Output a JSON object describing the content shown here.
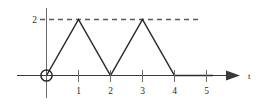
{
  "chart_data": {
    "type": "line",
    "title": "",
    "subtitle": "",
    "xlabel": "t",
    "ylabel": "",
    "x": [
      0,
      1,
      2,
      3,
      4,
      5.2
    ],
    "values": [
      0,
      2,
      0,
      2,
      0,
      0
    ],
    "series": [
      {
        "name": "x(t)",
        "x": [
          0,
          1,
          2,
          3,
          4,
          5.2
        ],
        "values": [
          0,
          2,
          0,
          2,
          0,
          0
        ]
      }
    ],
    "xlim": [
      -0.65,
      6.0
    ],
    "ylim": [
      -0.45,
      2.55
    ],
    "xticks": [
      1,
      2,
      3,
      4,
      5
    ],
    "xtick_labels": [
      "1",
      "2",
      "3",
      "4",
      "5"
    ],
    "yticks": [
      2
    ],
    "ytick_labels": [
      "2"
    ],
    "grid": false,
    "legend": false,
    "legend_position": "none",
    "annotations": [
      {
        "name": "amplitude-reference-line",
        "kind": "horizontal-dashed-line",
        "y": 2,
        "x_start": 0,
        "x_end": 5.5,
        "label": "2"
      },
      {
        "name": "origin-marker",
        "kind": "open-circle",
        "x": 0,
        "y": 0
      },
      {
        "name": "t-axis-arrow",
        "kind": "arrowhead",
        "x": 5.9,
        "y": 0
      }
    ],
    "colors": {
      "waveform": "#2b2b2b",
      "axis": "#3a3a3a",
      "dashed_reference": "#5a5a5a",
      "tick": "#6b6b6b",
      "text": "#2b2b2b",
      "background": "#ffffff"
    }
  },
  "labels": {
    "y_value_2": "2",
    "x_tick_1": "1",
    "x_tick_2": "2",
    "x_tick_3": "3",
    "x_tick_4": "4",
    "x_tick_5": "5",
    "t_axis": "t"
  }
}
